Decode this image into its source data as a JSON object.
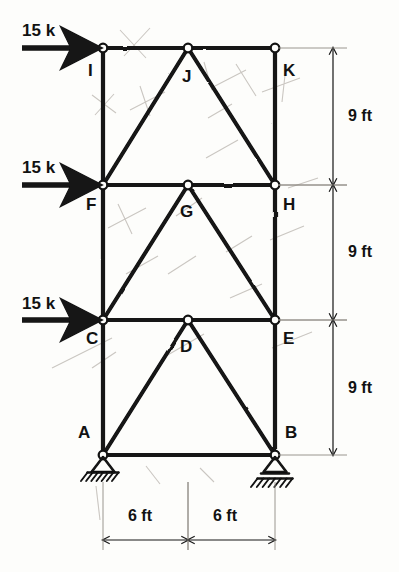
{
  "figure": {
    "type": "structural-frame-truss-diagram",
    "style": "hand-drawn pencil sketch, black ink on off-white paper",
    "ink_color": "#121212",
    "paper_color": "#fdfdfb"
  },
  "joints": [
    {
      "id": "A",
      "label": "A",
      "x": 103,
      "y": 455,
      "label_x": 78,
      "label_y": 424,
      "support": "pin"
    },
    {
      "id": "B",
      "label": "B",
      "x": 275,
      "y": 455,
      "label_x": 285,
      "label_y": 424,
      "support": "roller"
    },
    {
      "id": "C",
      "label": "C",
      "x": 103,
      "y": 320,
      "label_x": 86,
      "label_y": 330,
      "support": "none"
    },
    {
      "id": "D",
      "label": "D",
      "x": 188,
      "y": 320,
      "label_x": 180,
      "label_y": 338,
      "support": "none"
    },
    {
      "id": "E",
      "label": "E",
      "x": 275,
      "y": 320,
      "label_x": 283,
      "label_y": 330,
      "support": "none"
    },
    {
      "id": "F",
      "label": "F",
      "x": 103,
      "y": 185,
      "label_x": 86,
      "label_y": 196,
      "support": "none"
    },
    {
      "id": "G",
      "label": "G",
      "x": 188,
      "y": 185,
      "label_x": 180,
      "label_y": 203,
      "support": "none"
    },
    {
      "id": "H",
      "label": "H",
      "x": 275,
      "y": 185,
      "label_x": 283,
      "label_y": 196,
      "support": "none"
    },
    {
      "id": "I",
      "label": "I",
      "x": 103,
      "y": 48,
      "label_x": 88,
      "label_y": 62,
      "support": "none"
    },
    {
      "id": "J",
      "label": "J",
      "x": 188,
      "y": 48,
      "label_x": 182,
      "label_y": 68,
      "support": "none"
    },
    {
      "id": "K",
      "label": "K",
      "x": 275,
      "y": 48,
      "label_x": 283,
      "label_y": 62,
      "support": "none"
    }
  ],
  "members": [
    {
      "name": "column-A-C",
      "from": "A",
      "to": "C",
      "kind": "column"
    },
    {
      "name": "column-C-F",
      "from": "C",
      "to": "F",
      "kind": "column"
    },
    {
      "name": "column-F-I",
      "from": "F",
      "to": "I",
      "kind": "column"
    },
    {
      "name": "column-B-E",
      "from": "B",
      "to": "E",
      "kind": "column"
    },
    {
      "name": "column-E-H",
      "from": "E",
      "to": "H",
      "kind": "column"
    },
    {
      "name": "column-H-K",
      "from": "H",
      "to": "K",
      "kind": "column"
    },
    {
      "name": "beam-A-B",
      "from": "A",
      "to": "B",
      "kind": "beam"
    },
    {
      "name": "beam-C-D",
      "from": "C",
      "to": "D",
      "kind": "beam"
    },
    {
      "name": "beam-D-E",
      "from": "D",
      "to": "E",
      "kind": "beam"
    },
    {
      "name": "beam-F-G",
      "from": "F",
      "to": "G",
      "kind": "beam"
    },
    {
      "name": "beam-G-H",
      "from": "G",
      "to": "H",
      "kind": "beam"
    },
    {
      "name": "beam-I-J",
      "from": "I",
      "to": "J",
      "kind": "beam"
    },
    {
      "name": "beam-J-K",
      "from": "J",
      "to": "K",
      "kind": "beam"
    },
    {
      "name": "diagonal-A-D",
      "from": "A",
      "to": "D",
      "kind": "diagonal"
    },
    {
      "name": "diagonal-D-B",
      "from": "D",
      "to": "B",
      "kind": "diagonal"
    },
    {
      "name": "diagonal-C-G",
      "from": "C",
      "to": "G",
      "kind": "diagonal"
    },
    {
      "name": "diagonal-G-E",
      "from": "G",
      "to": "E",
      "kind": "diagonal"
    },
    {
      "name": "diagonal-F-J",
      "from": "F",
      "to": "J",
      "kind": "diagonal"
    },
    {
      "name": "diagonal-J-H",
      "from": "J",
      "to": "H",
      "kind": "diagonal"
    }
  ],
  "loads": [
    {
      "name": "load-at-I",
      "label": "15 k",
      "at_joint": "I",
      "direction": "right",
      "label_x": 22,
      "label_y": 22,
      "arrow_y": 48,
      "arrow_x1": 22,
      "arrow_x2": 96
    },
    {
      "name": "load-at-F",
      "label": "15 k",
      "at_joint": "F",
      "direction": "right",
      "label_x": 22,
      "label_y": 159,
      "arrow_y": 185,
      "arrow_x1": 22,
      "arrow_x2": 96
    },
    {
      "name": "load-at-C",
      "label": "15 k",
      "at_joint": "C",
      "direction": "right",
      "label_x": 22,
      "label_y": 295,
      "arrow_y": 320,
      "arrow_x1": 22,
      "arrow_x2": 96
    }
  ],
  "dimensions": {
    "vertical": [
      {
        "name": "story-height-top",
        "label": "9 ft",
        "from_y": 48,
        "to_y": 185,
        "line_x": 333,
        "label_x": 348,
        "label_y": 108
      },
      {
        "name": "story-height-middle",
        "label": "9 ft",
        "from_y": 185,
        "to_y": 320,
        "line_x": 333,
        "label_x": 348,
        "label_y": 244
      },
      {
        "name": "story-height-bottom",
        "label": "9 ft",
        "from_y": 320,
        "to_y": 455,
        "line_x": 333,
        "label_x": 348,
        "label_y": 380
      }
    ],
    "horizontal": [
      {
        "name": "bay-width-left",
        "label": "6 ft",
        "from_x": 103,
        "to_x": 188,
        "line_y": 540,
        "label_x": 128,
        "label_y": 508
      },
      {
        "name": "bay-width-right",
        "label": "6 ft",
        "from_x": 188,
        "to_x": 275,
        "line_y": 540,
        "label_x": 213,
        "label_y": 508
      }
    ]
  },
  "supports": {
    "A": {
      "name": "pin-support-A",
      "type": "pin",
      "x": 103,
      "y": 455
    },
    "B": {
      "name": "roller-support-B",
      "type": "roller",
      "x": 275,
      "y": 455
    }
  }
}
